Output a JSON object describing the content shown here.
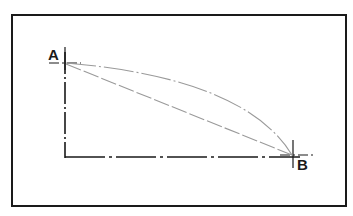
{
  "diagram": {
    "type": "trajectory-comparison",
    "points": {
      "A": {
        "label": "A",
        "x": 65,
        "y": 63
      },
      "B": {
        "label": "B",
        "x": 293,
        "y": 155
      }
    },
    "axes_corner": {
      "x": 65,
      "y": 158
    },
    "paths": [
      {
        "name": "straight-line",
        "style": "long-dash",
        "from": "A",
        "to": "B"
      },
      {
        "name": "curved-path",
        "style": "dash-dot",
        "from": "A",
        "to": "B",
        "shape": "convex-arc"
      }
    ],
    "colors": {
      "border": "#1a1a1a",
      "axes": "#1a1a1a",
      "paths": "#9a9a9a",
      "background": "#ffffff"
    }
  }
}
